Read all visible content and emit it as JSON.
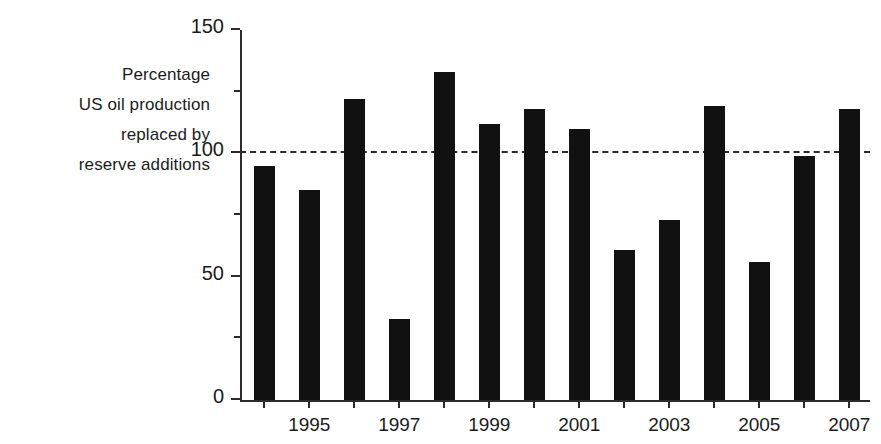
{
  "chart_data": {
    "type": "bar",
    "title": "",
    "subtitle": "",
    "xlabel": "",
    "ylabel": "Percentage US oil production replaced by reserve additions",
    "ylabel_lines": [
      "Percentage",
      "US oil production",
      "replaced by",
      "reserve additions"
    ],
    "categories": [
      "1994",
      "1995",
      "1996",
      "1997",
      "1998",
      "1999",
      "2000",
      "2001",
      "2002",
      "2003",
      "2004",
      "2005",
      "2006",
      "2007"
    ],
    "x_tick_labels": [
      "1995",
      "1997",
      "1999",
      "2001",
      "2003",
      "2005",
      "2007"
    ],
    "x_tick_indices": [
      1,
      3,
      5,
      7,
      9,
      11,
      13
    ],
    "values": [
      95,
      85,
      122,
      33,
      133,
      112,
      118,
      110,
      61,
      73,
      119,
      56,
      99,
      118
    ],
    "ylim": [
      0,
      150
    ],
    "y_major_ticks": [
      0,
      50,
      100,
      150
    ],
    "y_minor_ticks": [
      25,
      75,
      125
    ],
    "y_tick_labels": [
      "0",
      "50",
      "100",
      "150"
    ],
    "grid": false,
    "legend": null,
    "annotations": [
      {
        "name": "reference-line",
        "type": "hline",
        "value": 100,
        "style": "dashed",
        "color": "#2b2b2b"
      }
    ],
    "colors": {
      "bar": "#111111",
      "axis": "#2b2b2b",
      "text": "#1b1b1b",
      "background": "#ffffff"
    }
  }
}
